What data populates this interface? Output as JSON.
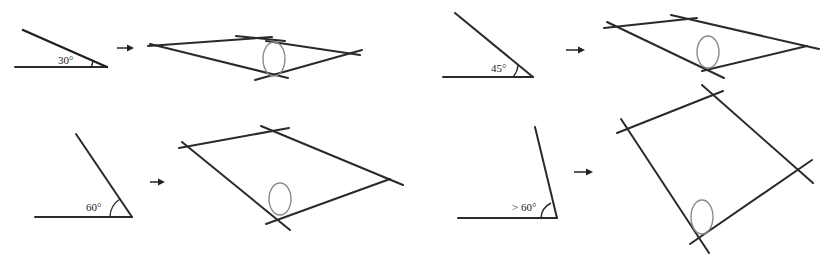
{
  "panels": [
    {
      "id": "panel-30",
      "angle_label": "30°",
      "angle": {
        "horizontal": [
          15,
          67,
          107,
          67
        ],
        "slant": [
          23,
          30,
          107,
          67
        ],
        "arc": "M 91 67 A 16 16 0 0 0 93 60",
        "label_pos": [
          58,
          64
        ]
      },
      "arrow": [
        117,
        48,
        133,
        48
      ],
      "quad": {
        "lines": [
          [
            148,
            46,
            272,
            37
          ],
          [
            236,
            36,
            285,
            41
          ],
          [
            150,
            44,
            288,
            78
          ],
          [
            255,
            80,
            362,
            50
          ],
          [
            266,
            41,
            360,
            55
          ]
        ],
        "ellipse": {
          "cx": 274,
          "cy": 59,
          "rx": 11,
          "ry": 17
        }
      }
    },
    {
      "id": "panel-45",
      "angle_label": "45°",
      "angle": {
        "horizontal": [
          443,
          77,
          533,
          77
        ],
        "slant": [
          455,
          13,
          533,
          77
        ],
        "arc": "M 513 77 A 20 20 0 0 0 518 64",
        "label_pos": [
          491,
          72
        ]
      },
      "arrow": [
        566,
        50,
        584,
        50
      ],
      "quad": {
        "lines": [
          [
            604,
            28,
            697,
            18
          ],
          [
            671,
            15,
            819,
            49
          ],
          [
            607,
            22,
            724,
            78
          ],
          [
            702,
            71,
            807,
            46
          ]
        ],
        "ellipse": {
          "cx": 708,
          "cy": 52,
          "rx": 11,
          "ry": 16
        }
      }
    },
    {
      "id": "panel-60",
      "angle_label": "60°",
      "angle": {
        "horizontal": [
          35,
          217,
          132,
          217
        ],
        "slant": [
          76,
          134,
          132,
          217
        ],
        "arc": "M 110 217 A 22 22 0 0 1 120 199",
        "label_pos": [
          86,
          211
        ]
      },
      "arrow": [
        150,
        182,
        164,
        182
      ],
      "quad": {
        "lines": [
          [
            179,
            148,
            289,
            128
          ],
          [
            261,
            126,
            403,
            185
          ],
          [
            182,
            142,
            290,
            230
          ],
          [
            266,
            224,
            390,
            179
          ]
        ],
        "ellipse": {
          "cx": 280,
          "cy": 199,
          "rx": 11,
          "ry": 16
        }
      }
    },
    {
      "id": "panel-gt60",
      "angle_label": "> 60°",
      "angle": {
        "horizontal": [
          458,
          218,
          557,
          218
        ],
        "slant": [
          535,
          127,
          557,
          218
        ],
        "arc": "M 541 218 A 18 18 0 0 1 551 203",
        "label_pos": [
          512,
          211
        ]
      },
      "arrow": [
        574,
        172,
        592,
        172
      ],
      "quad": {
        "lines": [
          [
            617,
            133,
            723,
            91
          ],
          [
            702,
            85,
            813,
            183
          ],
          [
            621,
            119,
            709,
            253
          ],
          [
            690,
            244,
            812,
            160
          ]
        ],
        "ellipse": {
          "cx": 702,
          "cy": 217,
          "rx": 11,
          "ry": 17
        }
      }
    }
  ]
}
